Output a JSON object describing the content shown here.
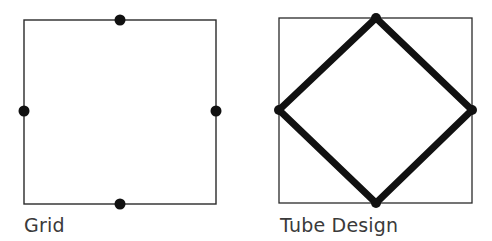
{
  "panels": [
    {
      "caption": "Grid",
      "square": {
        "x": 24,
        "y": 20,
        "w": 192,
        "h": 184
      },
      "dots": [
        {
          "cx": 120,
          "cy": 20
        },
        {
          "cx": 24,
          "cy": 111
        },
        {
          "cx": 216,
          "cy": 111
        },
        {
          "cx": 120,
          "cy": 204
        }
      ]
    },
    {
      "caption": "Tube Design",
      "square": {
        "x": 279,
        "y": 18,
        "w": 193,
        "h": 185
      },
      "diamond": [
        [
          376,
          18
        ],
        [
          472,
          110
        ],
        [
          376,
          203
        ],
        [
          279,
          110
        ]
      ]
    }
  ],
  "colors": {
    "line": "#2a2a2a",
    "heavy": "#111111",
    "text": "#3a3a3a"
  }
}
